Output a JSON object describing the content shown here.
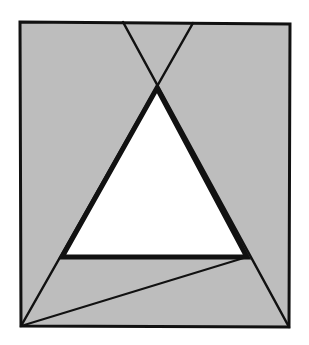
{
  "diagram": {
    "colors": {
      "background": "#ffffff",
      "region_fill": "#bdbdbd",
      "triangle_fill": "#ffffff",
      "stroke": "#111111"
    },
    "frame": {
      "points": [
        [
          20,
          22
        ],
        [
          290,
          24
        ],
        [
          289,
          327
        ],
        [
          21,
          326
        ]
      ],
      "stroke_width": 3
    },
    "triangle": {
      "points": [
        [
          157,
          88
        ],
        [
          62,
          257
        ],
        [
          247,
          257
        ]
      ],
      "stroke_width": 5
    },
    "lines": [
      {
        "name": "line-left-top-to-bottom-right",
        "from": [
          123,
          22
        ],
        "to": [
          289,
          327
        ],
        "stroke_width": 2.5
      },
      {
        "name": "line-right-top-to-bottom-left",
        "from": [
          193,
          23
        ],
        "to": [
          21,
          326
        ],
        "stroke_width": 2.5
      },
      {
        "name": "line-bottom-left-to-triangle-right",
        "from": [
          21,
          326
        ],
        "to": [
          247,
          257
        ],
        "stroke_width": 2
      }
    ]
  }
}
